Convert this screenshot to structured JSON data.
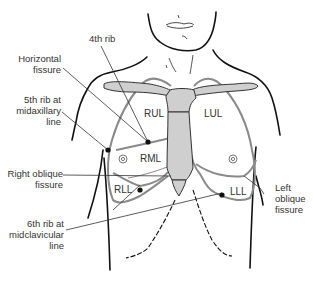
{
  "figure": {
    "colors": {
      "outline": "#111111",
      "lung": "#8a8a8a",
      "sternum_fill": "#cfcfcf",
      "leader_line": "#333333",
      "text": "#333333"
    }
  },
  "labels": {
    "rib4": "4th rib",
    "horizontal_fissure": [
      "Horizontal",
      "fissure"
    ],
    "rib5_midaxillary": [
      "5th rib at",
      "midaxillary",
      "line"
    ],
    "right_oblique": [
      "Right oblique",
      "fissure"
    ],
    "rib6_midclavicular": [
      "6th rib at",
      "midclavicular",
      "line"
    ],
    "left_oblique": [
      "Left",
      "oblique",
      "fissure"
    ]
  },
  "lobes": {
    "rul": "RUL",
    "rml": "RML",
    "rll": "RLL",
    "lul": "LUL",
    "lll": "LLL"
  }
}
